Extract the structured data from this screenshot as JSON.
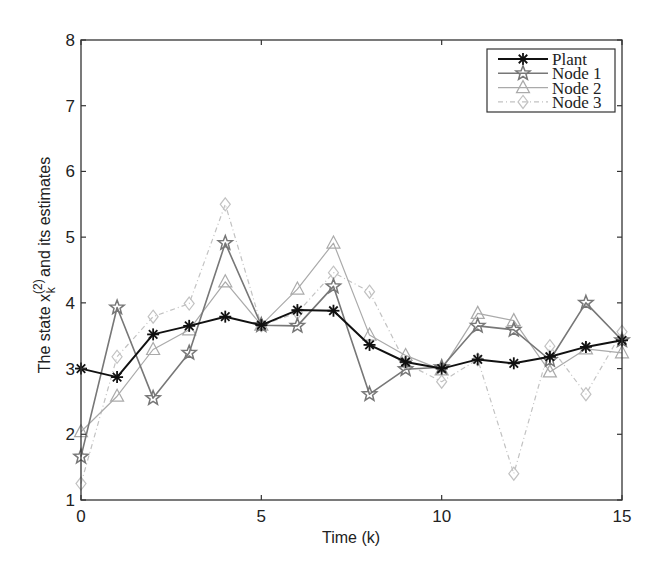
{
  "chart_data": {
    "type": "line",
    "title": "",
    "xlabel": "Time (k)",
    "ylabel": "The state x_k^(2) and its estimates",
    "ylabel_parts": {
      "prefix": "The state  x",
      "sup": "(2)",
      "sub": "k",
      "suffix": " and its estimates"
    },
    "xlim": [
      0,
      15
    ],
    "ylim": [
      1,
      8
    ],
    "xticks": [
      0,
      5,
      10,
      15
    ],
    "yticks": [
      1,
      2,
      3,
      4,
      5,
      6,
      7,
      8
    ],
    "grid": false,
    "legend_position": "upper right",
    "x": [
      0,
      1,
      2,
      3,
      4,
      5,
      6,
      7,
      8,
      9,
      10,
      11,
      12,
      13,
      14,
      15
    ],
    "series": [
      {
        "name": "Plant",
        "marker": "asterisk",
        "color": "#111111",
        "dash": "",
        "width": 2.0,
        "values": [
          3.0,
          2.87,
          3.52,
          3.65,
          3.79,
          3.66,
          3.89,
          3.88,
          3.36,
          3.1,
          3.0,
          3.14,
          3.08,
          3.18,
          3.33,
          3.43
        ]
      },
      {
        "name": "Node 1",
        "marker": "star",
        "color": "#777777",
        "dash": "",
        "width": 1.6,
        "values": [
          1.66,
          3.93,
          2.55,
          3.24,
          4.91,
          3.66,
          3.65,
          4.25,
          2.61,
          2.99,
          3.02,
          3.65,
          3.59,
          3.13,
          4.0,
          3.43
        ]
      },
      {
        "name": "Node 2",
        "marker": "triangle",
        "color": "#aaaaaa",
        "dash": "",
        "width": 1.2,
        "values": [
          2.04,
          2.58,
          3.29,
          3.59,
          4.32,
          3.66,
          4.21,
          4.91,
          3.51,
          3.2,
          2.98,
          3.84,
          3.73,
          2.95,
          3.3,
          3.24
        ]
      },
      {
        "name": "Node 3",
        "marker": "diamond",
        "color": "#c2c2c2",
        "dash": "5,3,1,3",
        "width": 1.2,
        "values": [
          1.25,
          3.18,
          3.79,
          3.99,
          5.5,
          3.66,
          3.85,
          4.46,
          4.17,
          3.08,
          2.8,
          3.14,
          1.4,
          3.34,
          2.61,
          3.56
        ]
      }
    ]
  },
  "layout": {
    "plot": {
      "left": 81,
      "top": 40,
      "right": 622,
      "bottom": 500
    },
    "legend": {
      "x": 487,
      "y": 49,
      "w": 128,
      "h": 63
    }
  }
}
